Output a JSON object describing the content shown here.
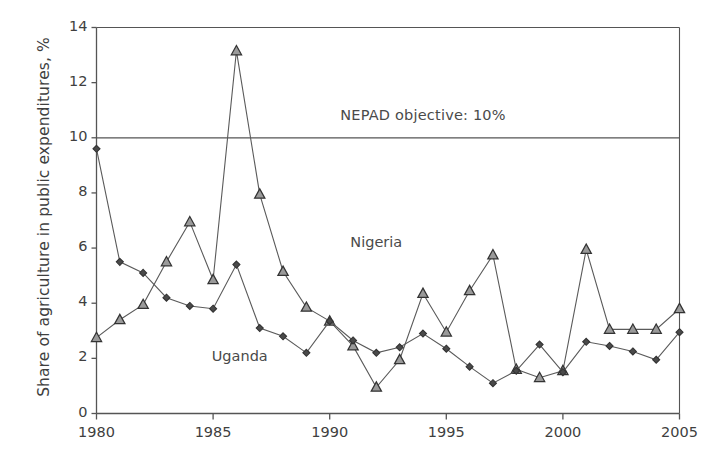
{
  "chart_data": {
    "type": "line",
    "title": "",
    "xlabel": "",
    "ylabel": "Share of agriculture in public expenditures, %",
    "xlim": [
      1980,
      2005
    ],
    "ylim": [
      0,
      14
    ],
    "xticks": [
      1980,
      1985,
      1990,
      1995,
      2000,
      2005
    ],
    "xtick_labels": [
      "1980",
      "1985",
      "1990",
      "1995",
      "2000",
      "2005"
    ],
    "yticks": [
      0,
      2,
      4,
      6,
      8,
      10,
      12,
      14
    ],
    "ytick_labels": [
      "0",
      "2",
      "4",
      "6",
      "8",
      "10",
      "12",
      "14"
    ],
    "grid": false,
    "legend_position": "inline-annotations",
    "x": [
      1980,
      1981,
      1982,
      1983,
      1984,
      1985,
      1986,
      1987,
      1988,
      1989,
      1990,
      1991,
      1992,
      1993,
      1994,
      1995,
      1996,
      1997,
      1998,
      1999,
      2000,
      2001,
      2002,
      2003,
      2004,
      2005
    ],
    "series": [
      {
        "name": "Nigeria",
        "marker": "triangle-up",
        "color": "#4a4a4a",
        "values": [
          2.75,
          3.4,
          3.95,
          5.5,
          6.95,
          4.85,
          13.15,
          7.95,
          5.15,
          3.85,
          3.35,
          2.45,
          0.95,
          1.95,
          4.35,
          2.95,
          4.45,
          5.75,
          1.6,
          1.3,
          1.55,
          5.95,
          3.05,
          3.05,
          3.05,
          3.8
        ]
      },
      {
        "name": "Uganda",
        "marker": "diamond",
        "color": "#4a4a4a",
        "values": [
          9.6,
          5.5,
          5.1,
          4.2,
          3.9,
          3.8,
          5.4,
          3.1,
          2.8,
          2.2,
          3.35,
          2.65,
          2.2,
          2.4,
          2.9,
          2.35,
          1.7,
          1.1,
          1.55,
          2.5,
          1.5,
          2.6,
          2.45,
          2.25,
          1.95,
          2.95
        ]
      }
    ],
    "annotations": [
      {
        "id": "nepad-objective",
        "text": "NEPAD objective: 10%",
        "value": 10,
        "kind": "horizontal-reference-line",
        "label_x": 1993.2,
        "label_y": 10.75
      },
      {
        "id": "nigeria-label",
        "text": "Nigeria",
        "label_x": 1992.0,
        "label_y": 6.15
      },
      {
        "id": "uganda-label",
        "text": "Uganda",
        "label_x": 1986.4,
        "label_y": 2.0
      }
    ],
    "axes_color": "#555555",
    "line_color": "#5a5a5a",
    "background_color": "#ffffff"
  }
}
